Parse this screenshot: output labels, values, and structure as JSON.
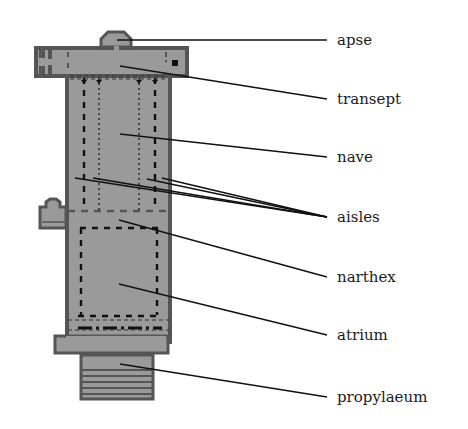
{
  "figure": {
    "type": "basilica-floor-plan",
    "colors": {
      "fill": "#9a9a9a",
      "wall": "#555555",
      "ink": "#111111",
      "background": "#ffffff"
    },
    "labels": [
      {
        "id": "apse",
        "text": "apse"
      },
      {
        "id": "transept",
        "text": "transept"
      },
      {
        "id": "nave",
        "text": "nave"
      },
      {
        "id": "aisles",
        "text": "aisles"
      },
      {
        "id": "narthex",
        "text": "narthex"
      },
      {
        "id": "atrium",
        "text": "atrium"
      },
      {
        "id": "propylaeum",
        "text": "propylaeum"
      }
    ]
  }
}
